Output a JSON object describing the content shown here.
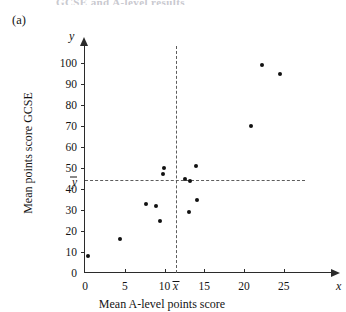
{
  "clipped_header": "GCSE and A-level results",
  "part_label": "(a)",
  "chart_data": {
    "type": "scatter",
    "title": "",
    "xlabel": "Mean A-level points score",
    "ylabel": "Mean points score GCSE",
    "x_var_symbol": "x",
    "y_var_symbol": "y",
    "xlim": [
      0,
      28
    ],
    "ylim": [
      0,
      108
    ],
    "grid": false,
    "legend": "none",
    "x_ticks": [
      0,
      5,
      10,
      15,
      20,
      25
    ],
    "y_ticks": [
      0,
      10,
      20,
      30,
      40,
      50,
      60,
      70,
      80,
      90,
      100
    ],
    "x_tick_labels": [
      "0",
      "5",
      "10",
      "15",
      "20",
      "25"
    ],
    "y_tick_labels": [
      "0",
      "10",
      "20",
      "30",
      "40",
      "50",
      "60",
      "70",
      "80",
      "90",
      "100"
    ],
    "mean_x": 11.5,
    "mean_y": 44.5,
    "mean_x_label": "x",
    "mean_y_label": "y",
    "points": [
      {
        "x": 0.4,
        "y": 8
      },
      {
        "x": 4.4,
        "y": 16
      },
      {
        "x": 7.7,
        "y": 33
      },
      {
        "x": 8.9,
        "y": 32
      },
      {
        "x": 9.4,
        "y": 25
      },
      {
        "x": 9.8,
        "y": 47
      },
      {
        "x": 9.9,
        "y": 50
      },
      {
        "x": 12.6,
        "y": 45
      },
      {
        "x": 13.1,
        "y": 29
      },
      {
        "x": 13.2,
        "y": 44
      },
      {
        "x": 14.0,
        "y": 51
      },
      {
        "x": 14.1,
        "y": 35
      },
      {
        "x": 20.9,
        "y": 70
      },
      {
        "x": 22.3,
        "y": 99
      },
      {
        "x": 24.5,
        "y": 95
      }
    ]
  }
}
